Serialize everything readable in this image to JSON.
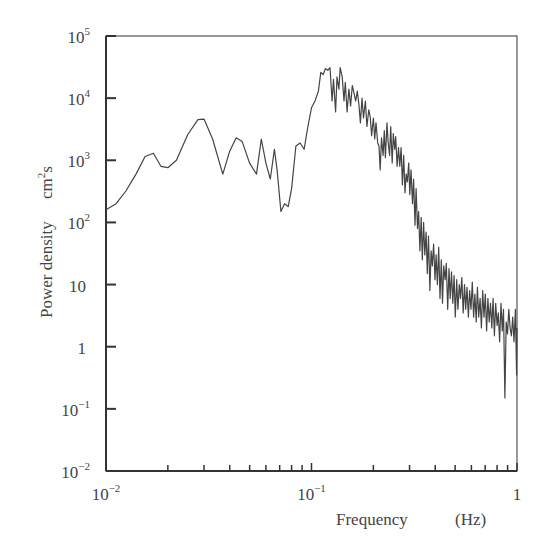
{
  "chart_data": {
    "type": "line",
    "title": "",
    "xlabel": "Frequency",
    "xlabel_unit": "(Hz)",
    "ylabel": "Power density",
    "ylabel_unit": "cm²s",
    "xscale": "log",
    "yscale": "log",
    "xlim": [
      0.01,
      1
    ],
    "ylim": [
      0.01,
      100000
    ],
    "grid": false,
    "legend": null,
    "x_tick_labels": [
      {
        "value": 0.01,
        "base": "10",
        "exp": "−2"
      },
      {
        "value": 0.1,
        "base": "10",
        "exp": "−1"
      },
      {
        "value": 1,
        "base": "1",
        "exp": ""
      }
    ],
    "y_tick_labels": [
      {
        "value": 100000,
        "base": "10",
        "exp": "5"
      },
      {
        "value": 10000,
        "base": "10",
        "exp": "4"
      },
      {
        "value": 1000,
        "base": "10",
        "exp": "3"
      },
      {
        "value": 100,
        "base": "10",
        "exp": "2"
      },
      {
        "value": 10,
        "base": "10",
        "exp": ""
      },
      {
        "value": 1,
        "base": "1",
        "exp": ""
      },
      {
        "value": 0.1,
        "base": "10",
        "exp": "−1"
      },
      {
        "value": 0.01,
        "base": "10",
        "exp": "−2"
      }
    ],
    "series": [
      {
        "name": "power spectrum",
        "color": "#444444",
        "points": [
          [
            0.01,
            160
          ],
          [
            0.0112,
            200
          ],
          [
            0.0125,
            320
          ],
          [
            0.014,
            600
          ],
          [
            0.0155,
            1150
          ],
          [
            0.017,
            1300
          ],
          [
            0.0185,
            800
          ],
          [
            0.02,
            760
          ],
          [
            0.022,
            1000
          ],
          [
            0.025,
            2600
          ],
          [
            0.028,
            4500
          ],
          [
            0.03,
            4600
          ],
          [
            0.033,
            2200
          ],
          [
            0.037,
            600
          ],
          [
            0.04,
            1400
          ],
          [
            0.043,
            2300
          ],
          [
            0.046,
            2000
          ],
          [
            0.05,
            900
          ],
          [
            0.054,
            600
          ],
          [
            0.057,
            2200
          ],
          [
            0.06,
            900
          ],
          [
            0.063,
            500
          ],
          [
            0.066,
            1500
          ],
          [
            0.068,
            700
          ],
          [
            0.071,
            150
          ],
          [
            0.074,
            200
          ],
          [
            0.077,
            180
          ],
          [
            0.08,
            350
          ],
          [
            0.084,
            1700
          ],
          [
            0.088,
            1900
          ],
          [
            0.092,
            1500
          ],
          [
            0.096,
            3500
          ],
          [
            0.1,
            7000
          ],
          [
            0.104,
            9000
          ],
          [
            0.108,
            13000
          ],
          [
            0.111,
            26000
          ],
          [
            0.114,
            24000
          ],
          [
            0.117,
            30000
          ],
          [
            0.12,
            28000
          ],
          [
            0.123,
            31000
          ],
          [
            0.126,
            9000
          ],
          [
            0.128,
            20000
          ],
          [
            0.131,
            6000
          ],
          [
            0.133,
            22000
          ],
          [
            0.136,
            14000
          ],
          [
            0.138,
            31000
          ],
          [
            0.141,
            22000
          ],
          [
            0.144,
            9000
          ],
          [
            0.146,
            18000
          ],
          [
            0.149,
            6000
          ],
          [
            0.152,
            14000
          ],
          [
            0.155,
            7500
          ],
          [
            0.158,
            16000
          ],
          [
            0.161,
            12000
          ],
          [
            0.164,
            9000
          ],
          [
            0.167,
            13000
          ],
          [
            0.17,
            8000
          ],
          [
            0.173,
            4000
          ],
          [
            0.176,
            10000
          ],
          [
            0.179,
            4800
          ],
          [
            0.183,
            9000
          ],
          [
            0.186,
            3500
          ],
          [
            0.19,
            6500
          ],
          [
            0.193,
            5000
          ],
          [
            0.196,
            2500
          ],
          [
            0.2,
            4800
          ],
          [
            0.203,
            2200
          ],
          [
            0.206,
            4000
          ],
          [
            0.21,
            1900
          ],
          [
            0.213,
            1700
          ],
          [
            0.216,
            700
          ],
          [
            0.219,
            2300
          ],
          [
            0.223,
            1200
          ],
          [
            0.226,
            3000
          ],
          [
            0.229,
            1100
          ],
          [
            0.233,
            4000
          ],
          [
            0.236,
            2000
          ],
          [
            0.24,
            1200
          ],
          [
            0.243,
            3500
          ],
          [
            0.247,
            900
          ],
          [
            0.25,
            2700
          ],
          [
            0.254,
            1500
          ],
          [
            0.257,
            2400
          ],
          [
            0.261,
            800
          ],
          [
            0.265,
            1600
          ],
          [
            0.269,
            800
          ],
          [
            0.273,
            1600
          ],
          [
            0.277,
            400
          ],
          [
            0.281,
            1200
          ],
          [
            0.285,
            300
          ],
          [
            0.289,
            600
          ],
          [
            0.293,
            450
          ],
          [
            0.297,
            900
          ],
          [
            0.301,
            280
          ],
          [
            0.305,
            700
          ],
          [
            0.31,
            200
          ],
          [
            0.314,
            500
          ],
          [
            0.319,
            90
          ],
          [
            0.323,
            350
          ],
          [
            0.328,
            80
          ],
          [
            0.332,
            150
          ],
          [
            0.337,
            35
          ],
          [
            0.342,
            120
          ],
          [
            0.346,
            25
          ],
          [
            0.351,
            100
          ],
          [
            0.356,
            30
          ],
          [
            0.361,
            70
          ],
          [
            0.366,
            15
          ],
          [
            0.371,
            60
          ],
          [
            0.377,
            8
          ],
          [
            0.382,
            35
          ],
          [
            0.387,
            20
          ],
          [
            0.393,
            45
          ],
          [
            0.399,
            12
          ],
          [
            0.404,
            30
          ],
          [
            0.41,
            10
          ],
          [
            0.416,
            40
          ],
          [
            0.422,
            6
          ],
          [
            0.428,
            25
          ],
          [
            0.434,
            5
          ],
          [
            0.44,
            20
          ],
          [
            0.447,
            12
          ],
          [
            0.453,
            22
          ],
          [
            0.46,
            4
          ],
          [
            0.467,
            18
          ],
          [
            0.473,
            6
          ],
          [
            0.48,
            16
          ],
          [
            0.487,
            5
          ],
          [
            0.494,
            14
          ],
          [
            0.501,
            3
          ],
          [
            0.509,
            12
          ],
          [
            0.516,
            4
          ],
          [
            0.524,
            10
          ],
          [
            0.531,
            6
          ],
          [
            0.539,
            13
          ],
          [
            0.547,
            3.5
          ],
          [
            0.555,
            10
          ],
          [
            0.563,
            4
          ],
          [
            0.571,
            9
          ],
          [
            0.58,
            3
          ],
          [
            0.588,
            8
          ],
          [
            0.597,
            4
          ],
          [
            0.606,
            11
          ],
          [
            0.615,
            3
          ],
          [
            0.624,
            7
          ],
          [
            0.633,
            2.5
          ],
          [
            0.642,
            9
          ],
          [
            0.651,
            3
          ],
          [
            0.661,
            6
          ],
          [
            0.671,
            2
          ],
          [
            0.681,
            8
          ],
          [
            0.691,
            3
          ],
          [
            0.701,
            7
          ],
          [
            0.711,
            1.8
          ],
          [
            0.722,
            6
          ],
          [
            0.732,
            2.5
          ],
          [
            0.743,
            5
          ],
          [
            0.754,
            2
          ],
          [
            0.765,
            6
          ],
          [
            0.776,
            1.5
          ],
          [
            0.788,
            5
          ],
          [
            0.8,
            2.2
          ],
          [
            0.811,
            3.5
          ],
          [
            0.823,
            1.2
          ],
          [
            0.836,
            5
          ],
          [
            0.848,
            1.8
          ],
          [
            0.86,
            4
          ],
          [
            0.873,
            0.15
          ],
          [
            0.886,
            2.5
          ],
          [
            0.899,
            1.6
          ],
          [
            0.912,
            4
          ],
          [
            0.926,
            2
          ],
          [
            0.939,
            1.5
          ],
          [
            0.953,
            3
          ],
          [
            0.967,
            1.2
          ],
          [
            0.982,
            4
          ],
          [
            0.996,
            0.35
          ],
          [
            1.0,
            2
          ]
        ]
      }
    ]
  }
}
